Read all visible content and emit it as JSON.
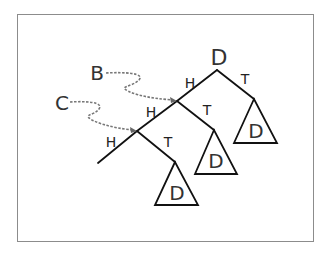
{
  "diagram": {
    "title": "",
    "root_label": "D",
    "pointer_labels": {
      "b": "B",
      "c": "C"
    },
    "edge_labels": {
      "root_h": "H",
      "root_t": "T",
      "b_h": "H",
      "b_t": "T",
      "c_h": "H",
      "c_t": "T"
    },
    "subtree_labels": {
      "right": "D",
      "middle": "D",
      "bottom": "D"
    },
    "colors": {
      "line": "#111111",
      "pointer": "#777777",
      "frame": "#8c8c8c",
      "text": "#333333"
    }
  }
}
